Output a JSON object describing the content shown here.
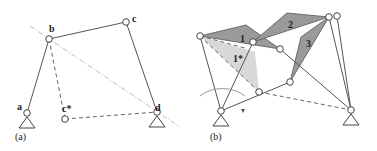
{
  "panel_a": {
    "caption": "(a)",
    "labels": {
      "a": "a",
      "b": "b",
      "c": "c",
      "c_star": "c*",
      "d": "d"
    }
  },
  "panel_b": {
    "caption": "(b)",
    "labels": {
      "t1": "1",
      "t1_star": "1*",
      "t2": "2",
      "t3": "3"
    }
  },
  "colors": {
    "link": "#555555",
    "triangle_dark": "#9a9a9a",
    "triangle_light": "#d8d8d8",
    "construction_line": "#bbbbbb"
  }
}
